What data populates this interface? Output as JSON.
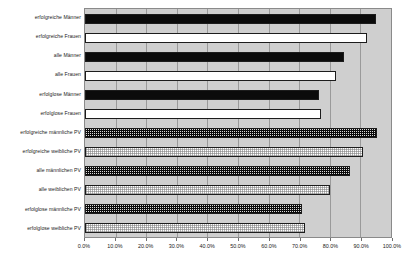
{
  "chart_data": {
    "type": "bar",
    "orientation": "horizontal",
    "title": "",
    "xlabel": "",
    "ylabel": "",
    "xlim": [
      0,
      100
    ],
    "grid": true,
    "legend": "none",
    "tick_labels": [
      "0.0%",
      "10.0%",
      "20.0%",
      "30.0%",
      "40.0%",
      "50.0%",
      "60.0%",
      "70.0%",
      "80.0%",
      "90.0%",
      "100.0%"
    ],
    "tick_values": [
      0,
      10,
      20,
      30,
      40,
      50,
      60,
      70,
      80,
      90,
      100
    ],
    "categories": [
      "erfolgreiche Männer",
      "erfolgreiche Frauen",
      "alle Männer",
      "alle Frauen",
      "erfolglose Männer",
      "erfolglose Frauen",
      "erfolgreiche männliche PV",
      "erfolgreiche weibliche PV",
      "alle männlichen PV",
      "alle weiblichen PV",
      "erfolglose männliche PV",
      "erfolglose weibliche PV"
    ],
    "values": [
      95.0,
      92.0,
      84.5,
      82.0,
      76.5,
      77.0,
      95.5,
      91.0,
      86.5,
      80.0,
      71.0,
      72.0
    ],
    "bar_styles": [
      "solid-black",
      "solid-white",
      "solid-black",
      "solid-white",
      "solid-black",
      "solid-white",
      "dotted-black",
      "dotted-white",
      "dotted-black",
      "dotted-white",
      "dotted-black",
      "dotted-white"
    ],
    "colors": {
      "plot_background": "#cfcfcf",
      "gridline": "#9a9a9a",
      "bar_dark": "#0b0b0b",
      "bar_light": "#ffffff",
      "bar_outline": "#1c1c1c",
      "text": "#1a1a1a",
      "page_background": "#ffffff"
    }
  }
}
